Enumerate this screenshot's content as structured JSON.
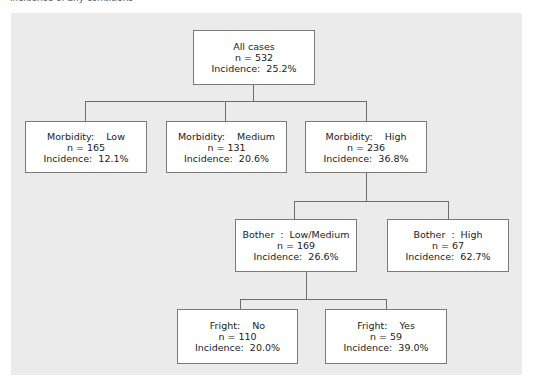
{
  "caption": "incidence of any conditions",
  "tree": {
    "root": {
      "label": "All cases",
      "n": "n = 532",
      "incidence": "Incidence:  25.2%"
    },
    "level1": [
      {
        "label": "Morbidity:    Low",
        "n": "n = 165",
        "incidence": "Incidence:  12.1%"
      },
      {
        "label": "Morbidity:    Medium",
        "n": "n = 131",
        "incidence": "Incidence:  20.6%"
      },
      {
        "label": "Morbidity:    High",
        "n": "n = 236",
        "incidence": "Incidence:  36.8%"
      }
    ],
    "level2": [
      {
        "label": "Bother  :  Low/Medium",
        "n": "n = 169",
        "incidence": "Incidence:  26.6%"
      },
      {
        "label": "Bother  :  High",
        "n": "n = 67",
        "incidence": "Incidence:  62.7%"
      }
    ],
    "level3": [
      {
        "label": "Fright:    No",
        "n": "n = 110",
        "incidence": "Incidence:  20.0%"
      },
      {
        "label": "Fright:    Yes",
        "n": "n = 59",
        "incidence": "Incidence:  39.0%"
      }
    ]
  },
  "colors": {
    "panel": "#ebebeb",
    "node_fill": "#ffffff",
    "line": "#6e6e6e"
  }
}
